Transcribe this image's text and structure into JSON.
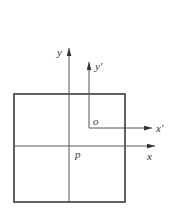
{
  "diagram": {
    "type": "coordinate-frames",
    "colors": {
      "line": "#3a3a3a",
      "axis": "#555555",
      "text": "#333333",
      "background": "#ffffff"
    },
    "square": {
      "x": 14,
      "y": 94,
      "width": 111,
      "height": 108
    },
    "frame_p": {
      "origin_label": "p",
      "x_label": "x",
      "y_label": "y",
      "origin": [
        69,
        146
      ],
      "x_axis_end": [
        155,
        146
      ],
      "y_axis_end": [
        69,
        48
      ]
    },
    "frame_o": {
      "origin_label": "o",
      "x_label": "x'",
      "y_label": "y'",
      "origin": [
        89,
        128
      ],
      "x_axis_end": [
        152,
        128
      ],
      "y_axis_end": [
        89,
        62
      ]
    }
  }
}
